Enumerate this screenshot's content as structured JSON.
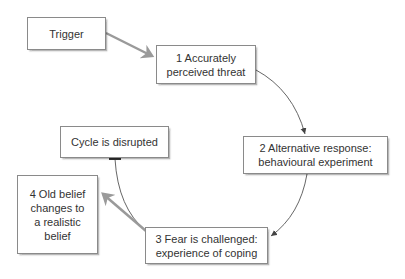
{
  "diagram": {
    "type": "cycle flowchart",
    "nodes": [
      {
        "id": "trigger",
        "label": "Trigger"
      },
      {
        "id": "step1",
        "label": "1 Accurately\nperceived threat"
      },
      {
        "id": "step2",
        "label": "2 Alternative response:\nbehavioural experiment"
      },
      {
        "id": "step3",
        "label": "3 Fear is challenged:\nexperience of coping"
      },
      {
        "id": "step4",
        "label": "4 Old belief\nchanges to\na realistic\nbelief"
      },
      {
        "id": "disrupted",
        "label": "Cycle is disrupted"
      }
    ],
    "edges": [
      {
        "from": "trigger",
        "to": "step1",
        "style": "thick grey arrow"
      },
      {
        "from": "step1",
        "to": "step2",
        "style": "thin curved arrow"
      },
      {
        "from": "step2",
        "to": "step3",
        "style": "thin curved arrow"
      },
      {
        "from": "step3",
        "to": "step4",
        "style": "thick grey arrow"
      },
      {
        "from": "step3",
        "to": "disrupted",
        "style": "thin curved line, bar end (blocked)"
      }
    ],
    "colors": {
      "border": "#8a8a8a",
      "thick_arrow": "#9a9a9a",
      "thin_line": "#555555",
      "text": "#333333"
    }
  }
}
